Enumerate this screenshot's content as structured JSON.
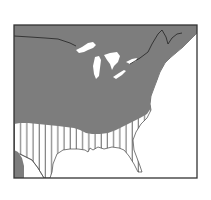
{
  "map": {
    "type": "range-map",
    "region": "Eastern North America",
    "legend": [
      {
        "pattern": "solid-gray",
        "meaning": "primary range"
      },
      {
        "pattern": "vertical-hatch",
        "meaning": "secondary range"
      }
    ],
    "colors": {
      "range_fill": "#7a7a7a",
      "hatch": "#555555",
      "water": "#ffffff",
      "border": "#333333",
      "background": "#ffffff"
    }
  }
}
